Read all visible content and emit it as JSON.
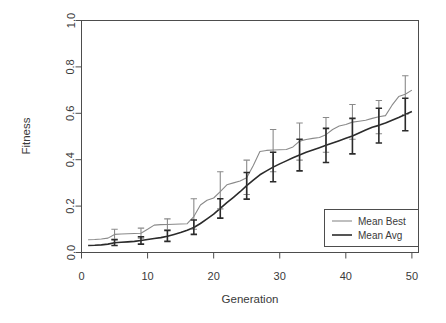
{
  "chart_data": {
    "type": "line",
    "title": "",
    "xlabel": "Generation",
    "ylabel": "Fitness",
    "xlim": [
      0,
      51
    ],
    "ylim": [
      0.0,
      1.0
    ],
    "grid": false,
    "legend_position": "bottom-right",
    "xticks": [
      0,
      10,
      20,
      30,
      40,
      50
    ],
    "xtick_labels": [
      "0",
      "10",
      "20",
      "30",
      "40",
      "50"
    ],
    "yticks": [
      0.0,
      0.2,
      0.4,
      0.6,
      0.8,
      1.0
    ],
    "ytick_labels": [
      "0.0",
      "0.2",
      "0.4",
      "0.6",
      "0.8",
      "1.0"
    ],
    "x": [
      1,
      2,
      3,
      4,
      5,
      6,
      7,
      8,
      9,
      10,
      11,
      12,
      13,
      14,
      15,
      16,
      17,
      18,
      19,
      20,
      21,
      22,
      23,
      24,
      25,
      26,
      27,
      28,
      29,
      30,
      31,
      32,
      33,
      34,
      35,
      36,
      37,
      38,
      39,
      40,
      41,
      42,
      43,
      44,
      45,
      46,
      47,
      48,
      49,
      50
    ],
    "series": [
      {
        "name": "Mean Best",
        "color": "#8a8a8a",
        "width": 1.1,
        "values": [
          0.055,
          0.056,
          0.058,
          0.062,
          0.078,
          0.08,
          0.081,
          0.082,
          0.083,
          0.1,
          0.118,
          0.12,
          0.121,
          0.122,
          0.123,
          0.124,
          0.155,
          0.205,
          0.225,
          0.235,
          0.262,
          0.292,
          0.3,
          0.308,
          0.322,
          0.375,
          0.435,
          0.44,
          0.442,
          0.443,
          0.444,
          0.455,
          0.48,
          0.487,
          0.492,
          0.496,
          0.508,
          0.53,
          0.545,
          0.552,
          0.562,
          0.566,
          0.57,
          0.578,
          0.585,
          0.59,
          0.635,
          0.672,
          0.682,
          0.7
        ],
        "errorbars": [
          {
            "x": 5,
            "y": 0.078,
            "lo": 0.058,
            "hi": 0.1
          },
          {
            "x": 9,
            "y": 0.083,
            "lo": 0.062,
            "hi": 0.105
          },
          {
            "x": 13,
            "y": 0.121,
            "lo": 0.098,
            "hi": 0.145
          },
          {
            "x": 17,
            "y": 0.155,
            "lo": 0.1,
            "hi": 0.232
          },
          {
            "x": 21,
            "y": 0.262,
            "lo": 0.188,
            "hi": 0.348
          },
          {
            "x": 25,
            "y": 0.322,
            "lo": 0.25,
            "hi": 0.398
          },
          {
            "x": 29,
            "y": 0.442,
            "lo": 0.348,
            "hi": 0.53
          },
          {
            "x": 33,
            "y": 0.48,
            "lo": 0.398,
            "hi": 0.558
          },
          {
            "x": 37,
            "y": 0.508,
            "lo": 0.432,
            "hi": 0.582
          },
          {
            "x": 41,
            "y": 0.562,
            "lo": 0.488,
            "hi": 0.638
          },
          {
            "x": 45,
            "y": 0.585,
            "lo": 0.512,
            "hi": 0.655
          },
          {
            "x": 49,
            "y": 0.682,
            "lo": 0.595,
            "hi": 0.762
          }
        ]
      },
      {
        "name": "Mean Avg",
        "color": "#2b2b2b",
        "width": 1.6,
        "values": [
          0.03,
          0.031,
          0.033,
          0.036,
          0.042,
          0.044,
          0.046,
          0.048,
          0.052,
          0.056,
          0.06,
          0.064,
          0.07,
          0.078,
          0.086,
          0.096,
          0.108,
          0.125,
          0.145,
          0.165,
          0.19,
          0.215,
          0.238,
          0.262,
          0.288,
          0.312,
          0.335,
          0.352,
          0.368,
          0.382,
          0.395,
          0.408,
          0.42,
          0.432,
          0.442,
          0.452,
          0.462,
          0.472,
          0.482,
          0.492,
          0.502,
          0.515,
          0.528,
          0.54,
          0.548,
          0.558,
          0.57,
          0.582,
          0.595,
          0.608
        ],
        "errorbars": [
          {
            "x": 5,
            "y": 0.042,
            "lo": 0.03,
            "hi": 0.055
          },
          {
            "x": 9,
            "y": 0.052,
            "lo": 0.036,
            "hi": 0.068
          },
          {
            "x": 13,
            "y": 0.07,
            "lo": 0.048,
            "hi": 0.095
          },
          {
            "x": 17,
            "y": 0.108,
            "lo": 0.078,
            "hi": 0.14
          },
          {
            "x": 21,
            "y": 0.19,
            "lo": 0.148,
            "hi": 0.232
          },
          {
            "x": 25,
            "y": 0.288,
            "lo": 0.23,
            "hi": 0.345
          },
          {
            "x": 29,
            "y": 0.368,
            "lo": 0.305,
            "hi": 0.432
          },
          {
            "x": 33,
            "y": 0.42,
            "lo": 0.352,
            "hi": 0.488
          },
          {
            "x": 37,
            "y": 0.462,
            "lo": 0.388,
            "hi": 0.535
          },
          {
            "x": 41,
            "y": 0.502,
            "lo": 0.425,
            "hi": 0.578
          },
          {
            "x": 45,
            "y": 0.548,
            "lo": 0.472,
            "hi": 0.622
          },
          {
            "x": 49,
            "y": 0.595,
            "lo": 0.525,
            "hi": 0.665
          }
        ]
      }
    ]
  },
  "legend": {
    "entries": [
      {
        "label": "Mean Best",
        "color": "#8a8a8a"
      },
      {
        "label": "Mean Avg",
        "color": "#2b2b2b"
      }
    ]
  }
}
